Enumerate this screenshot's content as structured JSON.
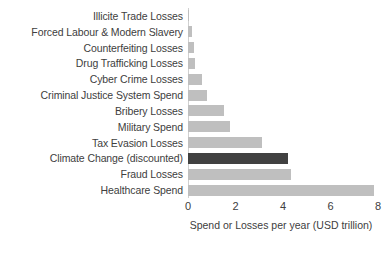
{
  "chart_data": {
    "type": "bar",
    "orientation": "horizontal",
    "title": "",
    "subtitle": "",
    "xlabel": "Spend or Losses per year (USD trillion)",
    "ylabel": "",
    "xlim": [
      0,
      8
    ],
    "xticks": [
      0,
      2,
      4,
      6,
      8
    ],
    "xtick_labels": [
      "0",
      "2",
      "4",
      "6",
      "8"
    ],
    "grid": false,
    "legend": null,
    "categories": [
      "Illicite Trade Losses",
      "Forced Labour & Modern Slavery",
      "Counterfeiting Losses",
      "Drug Trafficking Losses",
      "Cyber Crime Losses",
      "Criminal Justice System Spend",
      "Bribery Losses",
      "Military Spend",
      "Tax Evasion Losses",
      "Climate Change (discounted)",
      "Fraud Losses",
      "Healthcare Spend"
    ],
    "values": [
      0.03,
      0.15,
      0.25,
      0.3,
      0.6,
      0.8,
      1.5,
      1.75,
      3.1,
      4.2,
      4.35,
      7.85
    ],
    "highlight_index": 9,
    "colors": {
      "bar": "#bfbfbf",
      "bar_highlight": "#414141",
      "text": "#404040",
      "axis": "#d0d0d0",
      "background": "#ffffff"
    }
  }
}
